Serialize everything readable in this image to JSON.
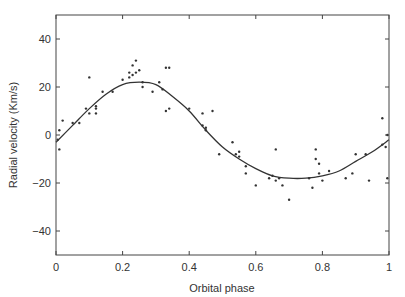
{
  "chart_data": {
    "type": "scatter",
    "title": "",
    "xlabel": "Orbital phase",
    "ylabel": "Radial velocity (Km/s)",
    "xlim": [
      0,
      1
    ],
    "ylim": [
      -50,
      50
    ],
    "xticks": [
      0,
      0.2,
      0.4,
      0.6,
      0.8,
      1
    ],
    "xtick_labels": [
      "0",
      "0.2",
      "0.4",
      "0.6",
      "0.8",
      "1"
    ],
    "yticks": [
      -40,
      -20,
      0,
      20,
      40
    ],
    "ytick_labels": [
      "−40",
      "−20",
      "0",
      "20",
      "40"
    ],
    "grid": false,
    "legend": null,
    "series": [
      {
        "name": "Observations",
        "kind": "scatter",
        "points": [
          [
            0.005,
            -2
          ],
          [
            0.01,
            2
          ],
          [
            0.01,
            -6
          ],
          [
            0.02,
            6
          ],
          [
            0.05,
            5
          ],
          [
            0.07,
            5
          ],
          [
            0.09,
            11
          ],
          [
            0.1,
            24
          ],
          [
            0.1,
            9
          ],
          [
            0.12,
            11
          ],
          [
            0.12,
            9
          ],
          [
            0.12,
            12
          ],
          [
            0.14,
            18
          ],
          [
            0.17,
            18
          ],
          [
            0.2,
            23
          ],
          [
            0.22,
            26
          ],
          [
            0.22,
            24
          ],
          [
            0.23,
            25
          ],
          [
            0.23,
            29
          ],
          [
            0.24,
            26
          ],
          [
            0.24,
            31
          ],
          [
            0.25,
            27
          ],
          [
            0.26,
            22
          ],
          [
            0.26,
            20
          ],
          [
            0.29,
            18
          ],
          [
            0.31,
            22
          ],
          [
            0.32,
            19
          ],
          [
            0.33,
            28
          ],
          [
            0.34,
            28
          ],
          [
            0.33,
            10
          ],
          [
            0.34,
            11
          ],
          [
            0.4,
            11
          ],
          [
            0.44,
            9
          ],
          [
            0.44,
            4
          ],
          [
            0.45,
            3
          ],
          [
            0.45,
            2
          ],
          [
            0.47,
            10
          ],
          [
            0.49,
            -8
          ],
          [
            0.53,
            -3
          ],
          [
            0.54,
            -8
          ],
          [
            0.55,
            -7
          ],
          [
            0.55,
            -9
          ],
          [
            0.57,
            -13
          ],
          [
            0.57,
            -16
          ],
          [
            0.6,
            -21
          ],
          [
            0.64,
            -18
          ],
          [
            0.65,
            -17
          ],
          [
            0.66,
            -6
          ],
          [
            0.66,
            -19
          ],
          [
            0.67,
            -18
          ],
          [
            0.68,
            -21
          ],
          [
            0.7,
            -27
          ],
          [
            0.76,
            -18
          ],
          [
            0.77,
            -22
          ],
          [
            0.78,
            -6
          ],
          [
            0.78,
            -10
          ],
          [
            0.79,
            -12
          ],
          [
            0.79,
            -16
          ],
          [
            0.8,
            -19
          ],
          [
            0.82,
            -15
          ],
          [
            0.87,
            -18
          ],
          [
            0.89,
            -16
          ],
          [
            0.9,
            -8
          ],
          [
            0.93,
            -8
          ],
          [
            0.94,
            -19
          ],
          [
            0.98,
            7
          ],
          [
            0.98,
            -4
          ],
          [
            0.99,
            -5
          ],
          [
            0.995,
            0
          ],
          [
            0.995,
            -18
          ]
        ]
      },
      {
        "name": "Fitted curve",
        "kind": "line",
        "points": [
          [
            0,
            -3
          ],
          [
            0.05,
            4
          ],
          [
            0.1,
            11
          ],
          [
            0.15,
            17
          ],
          [
            0.2,
            21
          ],
          [
            0.25,
            22
          ],
          [
            0.3,
            21
          ],
          [
            0.35,
            16
          ],
          [
            0.4,
            10
          ],
          [
            0.45,
            2
          ],
          [
            0.5,
            -5
          ],
          [
            0.55,
            -10
          ],
          [
            0.6,
            -14
          ],
          [
            0.65,
            -17
          ],
          [
            0.7,
            -18
          ],
          [
            0.75,
            -18
          ],
          [
            0.8,
            -17
          ],
          [
            0.85,
            -15
          ],
          [
            0.9,
            -11
          ],
          [
            0.95,
            -7
          ],
          [
            1,
            -2
          ]
        ]
      }
    ]
  }
}
